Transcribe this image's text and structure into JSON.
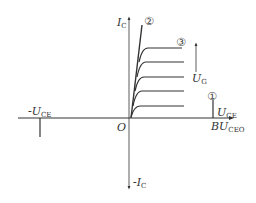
{
  "diagram": {
    "type": "transistor-IV-characteristic",
    "axes": {
      "y_pos_label": "I",
      "y_pos_sub": "C",
      "y_neg_label": "-I",
      "y_neg_sub": "C",
      "x_pos_label": "U",
      "x_pos_sub": "CE",
      "x_neg_label": "-U",
      "x_neg_sub": "CE",
      "origin_label": "O"
    },
    "breakdown_label": "BU",
    "breakdown_sub": "CEO",
    "gate_label": "U",
    "gate_sub": "G",
    "markers": [
      "①",
      "②",
      "③"
    ],
    "curve_levels": 5
  }
}
